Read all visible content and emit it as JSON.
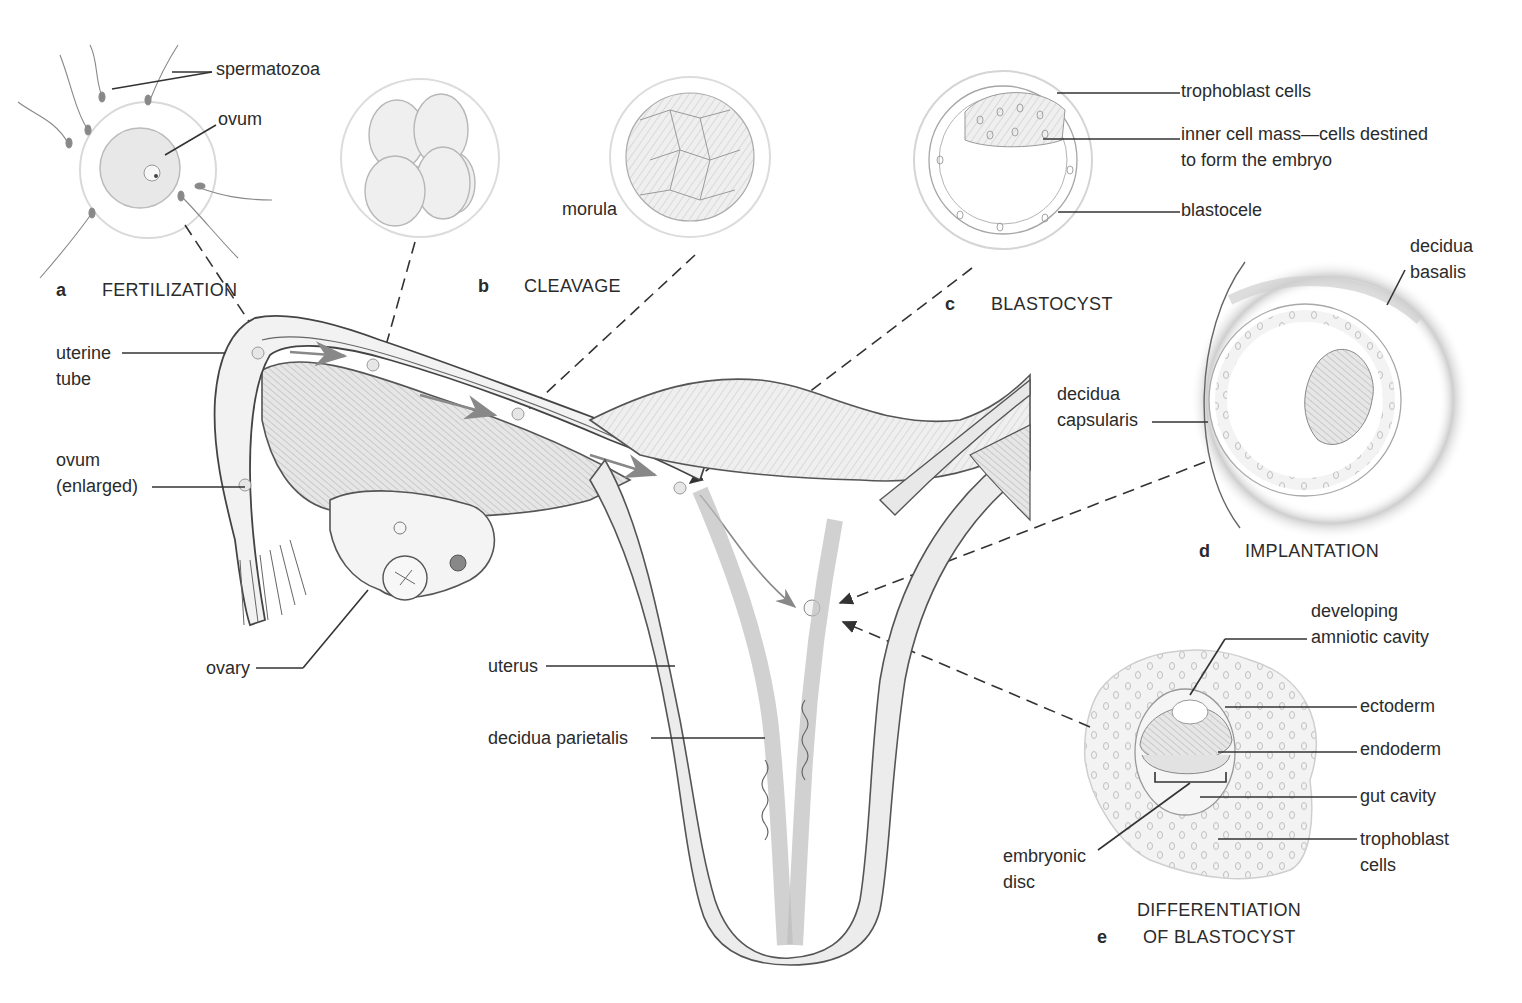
{
  "figure": {
    "panels": [
      {
        "id": "a",
        "letter": "a",
        "title": "FERTILIZATION"
      },
      {
        "id": "b",
        "letter": "b",
        "title": "CLEAVAGE"
      },
      {
        "id": "c",
        "letter": "c",
        "title": "BLASTOCYST"
      },
      {
        "id": "d",
        "letter": "d",
        "title": "IMPLANTATION"
      },
      {
        "id": "e",
        "letter": "e",
        "title_line1": "DIFFERENTIATION",
        "title_line2": "OF BLASTOCYST"
      }
    ],
    "labels": {
      "spermatozoa": "spermatozoa",
      "ovum": "ovum",
      "morula": "morula",
      "trophoblast_cells": "trophoblast cells",
      "inner_cell_mass_line1": "inner cell mass—cells destined",
      "inner_cell_mass_line2": "to form the embryo",
      "blastocele": "blastocele",
      "decidua_basalis_line1": "decidua",
      "decidua_basalis_line2": "basalis",
      "decidua_capsularis_line1": "decidua",
      "decidua_capsularis_line2": "capsularis",
      "uterine_tube_line1": "uterine",
      "uterine_tube_line2": "tube",
      "ovum_enlarged_line1": "ovum",
      "ovum_enlarged_line2": "(enlarged)",
      "ovary": "ovary",
      "uterus": "uterus",
      "decidua_parietalis": "decidua parietalis",
      "developing_amniotic_line1": "developing",
      "developing_amniotic_line2": "amniotic cavity",
      "ectoderm": "ectoderm",
      "endoderm": "endoderm",
      "gut_cavity": "gut cavity",
      "trophoblast_e_line1": "trophoblast",
      "trophoblast_e_line2": "cells",
      "embryonic_disc_line1": "embryonic",
      "embryonic_disc_line2": "disc"
    },
    "colors": {
      "ink": "#2b2b2b",
      "tissue_fill": "#ececec",
      "tissue_dark": "#cfcfcf",
      "outline": "#555555",
      "membrane": "#d8d8d8"
    }
  }
}
